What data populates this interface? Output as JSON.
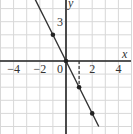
{
  "chart_data": {
    "type": "line",
    "title": "",
    "xlabel": "x",
    "ylabel": "y",
    "xlim": [
      -5,
      5
    ],
    "ylim": [
      -5.5,
      4.5
    ],
    "grid": true,
    "x_ticks": [
      -4,
      -2,
      0,
      2,
      4
    ],
    "x_tick_labels": [
      "−4",
      "−2",
      "0",
      "2",
      "4"
    ],
    "y_ticks": [
      3
    ],
    "y_tick_labels": [
      "3"
    ],
    "series": [
      {
        "name": "y = -2x",
        "equation": "y = -2x",
        "points": [
          [
            -1,
            2
          ],
          [
            0,
            0
          ],
          [
            1,
            -2
          ],
          [
            2,
            -4
          ]
        ]
      }
    ],
    "annotations": [
      {
        "type": "dashed-vertical",
        "x": 1,
        "from_y": 0,
        "to_y": -2
      }
    ],
    "colors": {
      "line": "#333333",
      "grid": "#d8d8d8",
      "axis": "#222222"
    }
  }
}
